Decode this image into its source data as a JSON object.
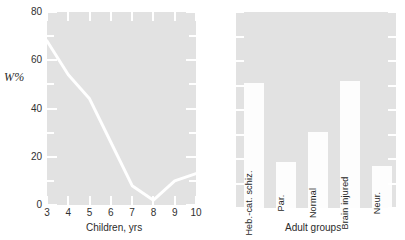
{
  "figure": {
    "background_color": "#ffffff",
    "panel_fill_color": "#e2e2e2",
    "data_color": "#ffffff",
    "text_color": "#222222"
  },
  "chart_data": [
    {
      "type": "line",
      "title": "",
      "xlabel": "Children, yrs",
      "ylabel": "W%",
      "xlim": [
        3,
        10
      ],
      "ylim": [
        0,
        80
      ],
      "grid": false,
      "legend": "none",
      "x_ticks": [
        3,
        4,
        5,
        6,
        7,
        8,
        9,
        10
      ],
      "x_tick_labels": [
        "3",
        "4",
        "5",
        "6",
        "7",
        "8",
        "9",
        "10"
      ],
      "y_ticks": [
        0,
        20,
        40,
        60,
        80
      ],
      "y_tick_labels": [
        "0",
        "20",
        "40",
        "60",
        "80"
      ],
      "y_minor_ticks": [
        10,
        30,
        50,
        70
      ],
      "x": [
        3,
        4,
        5,
        6,
        7,
        8,
        9,
        10
      ],
      "values": [
        68,
        54,
        44,
        26,
        8,
        2,
        10,
        13
      ],
      "series_name": "W%"
    },
    {
      "type": "bar",
      "title": "",
      "xlabel": "Adult groups",
      "ylabel": "",
      "ylim": [
        0,
        80
      ],
      "grid": false,
      "legend": "none",
      "y_minor_ticks": [
        10,
        20,
        30,
        40,
        50,
        60,
        70
      ],
      "categories": [
        "Heb.-cat. schiz.",
        "Par.",
        "Normal",
        "Brain injured",
        "Neur."
      ],
      "values": [
        51,
        19,
        31,
        52,
        17
      ]
    }
  ],
  "left_panel": {
    "y_axis_title": "W%",
    "x_axis_title": "Children, yrs",
    "y_tick_labels": [
      "0",
      "20",
      "40",
      "60",
      "80"
    ],
    "x_tick_labels": [
      "3",
      "4",
      "5",
      "6",
      "7",
      "8",
      "9",
      "10"
    ]
  },
  "right_panel": {
    "x_axis_title": "Adult groups",
    "bars": [
      {
        "label": "Heb.-cat. schiz.",
        "value": 51
      },
      {
        "label": "Par.",
        "value": 19
      },
      {
        "label": "Normal",
        "value": 31
      },
      {
        "label": "Brain injured",
        "value": 52
      },
      {
        "label": "Neur.",
        "value": 17
      }
    ]
  }
}
